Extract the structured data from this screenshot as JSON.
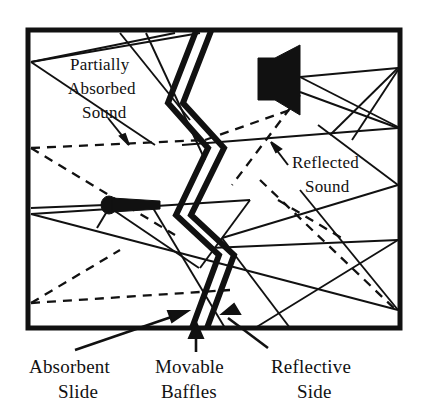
{
  "figure": {
    "background_color": "#ffffff",
    "ink_color": "#111111",
    "frame": {
      "x": 28,
      "y": 30,
      "width": 372,
      "height": 298,
      "stroke_width": 5
    }
  },
  "annotations": {
    "partially_absorbed": {
      "lines": [
        "Partially",
        "Absorbed",
        "Sound"
      ],
      "line1": "Partially",
      "line2": "Absorbed",
      "line3": "Sound"
    },
    "reflected": {
      "lines": [
        "Reflected",
        "Sound"
      ],
      "line1": "Reflected",
      "line2": "Sound"
    }
  },
  "captions": {
    "absorbent_slide": {
      "line1": "Absorbent",
      "line2": "Slide"
    },
    "movable_baffles": {
      "line1": "Movable",
      "line2": "Baffles"
    },
    "reflective_side": {
      "line1": "Reflective",
      "line2": "Side"
    }
  },
  "objects": {
    "speaker": {
      "name": "loudspeaker",
      "fill": "#111111"
    },
    "microphone": {
      "name": "microphone",
      "fill": "#111111"
    },
    "baffles": {
      "name": "zigzag-movable-baffles",
      "stroke": "#111111",
      "stroke_width": 6
    }
  },
  "ray_legend": {
    "reflected_style": "solid",
    "absorbed_style": "dashed"
  }
}
